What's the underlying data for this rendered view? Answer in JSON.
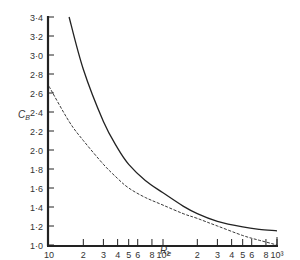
{
  "chart_data": {
    "type": "line",
    "title": "",
    "xlabel": "R_e",
    "ylabel": "C_B",
    "xscale": "log",
    "xlim": [
      10,
      1000
    ],
    "ylim": [
      1.0,
      3.4
    ],
    "grid": false,
    "legend": null,
    "y_ticks": [
      "1.0",
      "1.2",
      "1.4",
      "1.6",
      "1.8",
      "2.0",
      "2.2",
      "2.4",
      "2.6",
      "2.8",
      "3.0",
      "3.2",
      "3.4"
    ],
    "x_tick_labels": [
      {
        "v": 10,
        "label": "10"
      },
      {
        "v": 20,
        "label": "2"
      },
      {
        "v": 30,
        "label": "3"
      },
      {
        "v": 40,
        "label": "4"
      },
      {
        "v": 50,
        "label": "5"
      },
      {
        "v": 60,
        "label": "6"
      },
      {
        "v": 80,
        "label": "8"
      },
      {
        "v": 100,
        "label": "10²"
      },
      {
        "v": 200,
        "label": "2"
      },
      {
        "v": 300,
        "label": "3"
      },
      {
        "v": 400,
        "label": "4"
      },
      {
        "v": 500,
        "label": "5"
      },
      {
        "v": 600,
        "label": "6"
      },
      {
        "v": 800,
        "label": "8"
      },
      {
        "v": 1000,
        "label": "10³"
      }
    ],
    "series": [
      {
        "name": "solid",
        "style": "solid",
        "x": [
          15,
          20,
          30,
          40,
          50,
          70,
          100,
          150,
          200,
          300,
          500,
          700,
          1000
        ],
        "y": [
          3.4,
          2.85,
          2.3,
          2.02,
          1.85,
          1.68,
          1.55,
          1.41,
          1.33,
          1.25,
          1.19,
          1.165,
          1.15
        ]
      },
      {
        "name": "dashed",
        "style": "dashed",
        "x": [
          10,
          15,
          20,
          30,
          40,
          50,
          70,
          100,
          150,
          200,
          300,
          500,
          700,
          1000
        ],
        "y": [
          2.67,
          2.3,
          2.1,
          1.85,
          1.7,
          1.6,
          1.5,
          1.42,
          1.33,
          1.28,
          1.2,
          1.1,
          1.05,
          1.0
        ]
      }
    ]
  }
}
